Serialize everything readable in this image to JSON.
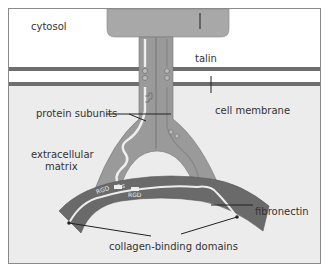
{
  "labels": {
    "cytosol": "cytosol",
    "talin": "talin",
    "protein_subunits": "protein subunits",
    "cell_membrane": "cell membrane",
    "extracellular_matrix_line1": "extracellular",
    "extracellular_matrix_line2": "matrix",
    "fibronectin": "fibronectin",
    "collagen_binding_domains": "collagen-binding domains",
    "rgd_left": "RGD",
    "rgd_right": "RGD",
    "ss": "S S"
  },
  "colors": {
    "cytosol_bg": "#ffffff",
    "extracellular_bg": "#ececec",
    "membrane": "#6e6e6e",
    "talin": "#a8a8a8",
    "integrin": "#9a9a9a",
    "fibronectin": "#6a6a6a",
    "strand": "#f2f2f2"
  }
}
